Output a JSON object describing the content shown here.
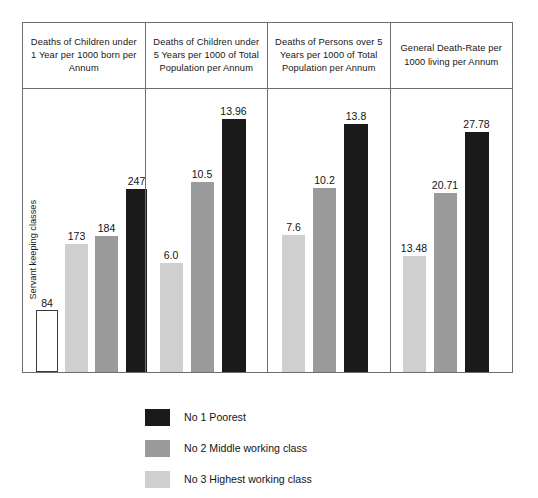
{
  "chart_data": {
    "type": "bar",
    "title": "",
    "xlabel": "",
    "ylabel": "",
    "grid": false,
    "legend_position": "bottom",
    "categories": [
      "Deaths of Children under 1 Year per 1000 born per Annum",
      "Deaths of Children under 5 Years per 1000 of Total Population per Annum",
      "Deaths of Persons over 5 Years per 1000 of Total Population per Annum",
      "General Death-Rate per 1000 living per Annum"
    ],
    "series": [
      {
        "name": "Servant keeping classes",
        "color": "#ffffff",
        "values": [
          84,
          null,
          null,
          null
        ]
      },
      {
        "name": "No 3 Highest working class",
        "color": "#cfcfcf",
        "values": [
          173,
          6.0,
          7.6,
          13.48
        ]
      },
      {
        "name": "No 2 Middle working class",
        "color": "#9a9a9a",
        "values": [
          184,
          10.5,
          10.2,
          20.71
        ]
      },
      {
        "name": "No 1 Poorest",
        "color": "#1a1a1a",
        "values": [
          247,
          13.96,
          13.8,
          27.78
        ]
      }
    ],
    "value_labels": {
      "col1": [
        "84",
        "173",
        "184",
        "247"
      ],
      "col2": [
        "6.0",
        "10.5",
        "13.96"
      ],
      "col3": [
        "7.6",
        "10.2",
        "13.8"
      ],
      "col4": [
        "13.48",
        "20.71",
        "27.78"
      ]
    }
  },
  "headers": [
    "Deaths of Children under 1 Year per 1000 born per Annum",
    "Deaths of Children under 5 Years per 1000 of Total Population per Annum",
    "Deaths of Persons over 5 Years per 1000 of Total Population per Annum",
    "General Death-Rate per 1000 living per Annum"
  ],
  "columns": [
    {
      "bars": [
        {
          "label": "84",
          "value": 84,
          "class": "servant",
          "height_px": 62,
          "left_px": 13,
          "width_px": 22
        },
        {
          "label": "173",
          "value": 173,
          "class": "highest",
          "height_px": 128,
          "left_px": 42,
          "width_px": 23
        },
        {
          "label": "184",
          "value": 184,
          "class": "middle",
          "height_px": 136,
          "left_px": 72,
          "width_px": 23
        },
        {
          "label": "247",
          "value": 247,
          "class": "poorest",
          "height_px": 183,
          "left_px": 103,
          "width_px": 21
        }
      ],
      "vertical_caption": "Servant keeping classes"
    },
    {
      "bars": [
        {
          "label": "6.0",
          "value": 6.0,
          "class": "highest",
          "height_px": 109,
          "left_px": 14,
          "width_px": 23
        },
        {
          "label": "10.5",
          "value": 10.5,
          "class": "middle",
          "height_px": 190,
          "left_px": 45,
          "width_px": 23
        },
        {
          "label": "13.96",
          "value": 13.96,
          "class": "poorest",
          "height_px": 253,
          "left_px": 76,
          "width_px": 24
        }
      ],
      "vertical_caption": ""
    },
    {
      "bars": [
        {
          "label": "7.6",
          "value": 7.6,
          "class": "highest",
          "height_px": 137,
          "left_px": 14,
          "width_px": 23
        },
        {
          "label": "10.2",
          "value": 10.2,
          "class": "middle",
          "height_px": 184,
          "left_px": 45,
          "width_px": 23
        },
        {
          "label": "13.8",
          "value": 13.8,
          "class": "poorest",
          "height_px": 248,
          "left_px": 76,
          "width_px": 24
        }
      ],
      "vertical_caption": ""
    },
    {
      "bars": [
        {
          "label": "13.48",
          "value": 13.48,
          "class": "highest",
          "height_px": 116,
          "left_px": 12,
          "width_px": 23
        },
        {
          "label": "20.71",
          "value": 20.71,
          "class": "middle",
          "height_px": 179,
          "left_px": 43,
          "width_px": 23
        },
        {
          "label": "27.78",
          "value": 27.78,
          "class": "poorest",
          "height_px": 240,
          "left_px": 74,
          "width_px": 24
        }
      ],
      "vertical_caption": ""
    }
  ],
  "legend": [
    {
      "label": "No 1 Poorest",
      "class": "poorest",
      "color": "#1a1a1a"
    },
    {
      "label": "No 2 Middle working class",
      "class": "middle",
      "color": "#9a9a9a"
    },
    {
      "label": "No 3 Highest working class",
      "class": "highest",
      "color": "#cfcfcf"
    }
  ]
}
